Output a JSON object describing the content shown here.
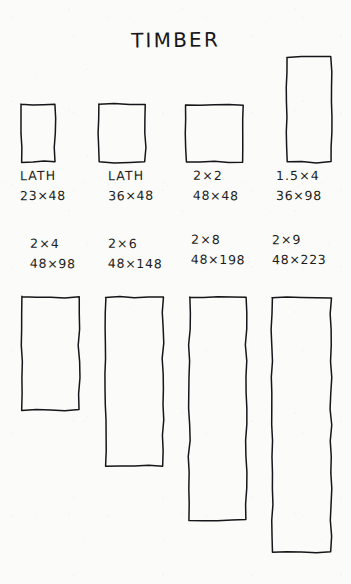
{
  "page": {
    "title": "TIMBER",
    "background_color": "#fbfbfa",
    "ink_color": "#16161a",
    "medium": "hand-drawn pen on paper"
  },
  "chart_data": {
    "type": "bar",
    "title": "TIMBER",
    "subtitle": "",
    "xlabel": "",
    "ylabel": "",
    "units": "mm",
    "note": "Scale drawing of timber cross-sections; each rectangle is drawn to scale of its nominal width x height in millimetres.",
    "categories": [
      "LATH",
      "LATH",
      "2×2",
      "1.5×4",
      "2×4",
      "2×6",
      "2×8",
      "2×9"
    ],
    "values": [
      48,
      48,
      48,
      98,
      98,
      148,
      198,
      223
    ],
    "widths_mm": [
      23,
      36,
      48,
      36,
      48,
      48,
      48,
      48
    ],
    "heights_mm": [
      48,
      48,
      48,
      98,
      98,
      148,
      198,
      223
    ],
    "rows": [
      {
        "row": 1,
        "items": [
          {
            "name": "LATH",
            "dimension_label": "LATH",
            "size_label": "23×48",
            "width_mm": 23,
            "height_mm": 48,
            "rect": {
              "x": 22,
              "y": 104,
              "w": 33,
              "h": 58
            },
            "label_pos": {
              "x": 20,
              "y": 170
            }
          },
          {
            "name": "LATH",
            "dimension_label": "LATH",
            "size_label": "36×48",
            "width_mm": 36,
            "height_mm": 48,
            "rect": {
              "x": 99,
              "y": 104,
              "w": 46,
              "h": 58
            },
            "label_pos": {
              "x": 108,
              "y": 170
            }
          },
          {
            "name": "2x2",
            "dimension_label": "2×2",
            "size_label": "48×48",
            "width_mm": 48,
            "height_mm": 48,
            "rect": {
              "x": 186,
              "y": 105,
              "w": 57,
              "h": 57
            },
            "label_pos": {
              "x": 193,
              "y": 170
            }
          },
          {
            "name": "1.5x4",
            "dimension_label": "1.5×4",
            "size_label": "36×98",
            "width_mm": 36,
            "height_mm": 98,
            "rect": {
              "x": 287,
              "y": 57,
              "w": 44,
              "h": 105
            },
            "label_pos": {
              "x": 276,
              "y": 170
            }
          }
        ]
      },
      {
        "row": 2,
        "items": [
          {
            "name": "2x4",
            "dimension_label": "2×4",
            "size_label": "48×98",
            "width_mm": 48,
            "height_mm": 98,
            "rect": {
              "x": 22,
              "y": 297,
              "w": 57,
              "h": 113
            },
            "label_pos": {
              "x": 30,
              "y": 238
            }
          },
          {
            "name": "2x6",
            "dimension_label": "2×6",
            "size_label": "48×148",
            "width_mm": 48,
            "height_mm": 148,
            "rect": {
              "x": 106,
              "y": 297,
              "w": 57,
              "h": 169
            },
            "label_pos": {
              "x": 108,
              "y": 238
            }
          },
          {
            "name": "2x8",
            "dimension_label": "2×8",
            "size_label": "48×198",
            "width_mm": 48,
            "height_mm": 198,
            "rect": {
              "x": 189,
              "y": 297,
              "w": 57,
              "h": 223
            },
            "label_pos": {
              "x": 191,
              "y": 234
            }
          },
          {
            "name": "2x9",
            "dimension_label": "2×9",
            "size_label": "48×223",
            "width_mm": 48,
            "height_mm": 223,
            "rect": {
              "x": 272,
              "y": 298,
              "w": 59,
              "h": 254
            },
            "label_pos": {
              "x": 272,
              "y": 234
            }
          }
        ]
      }
    ]
  }
}
